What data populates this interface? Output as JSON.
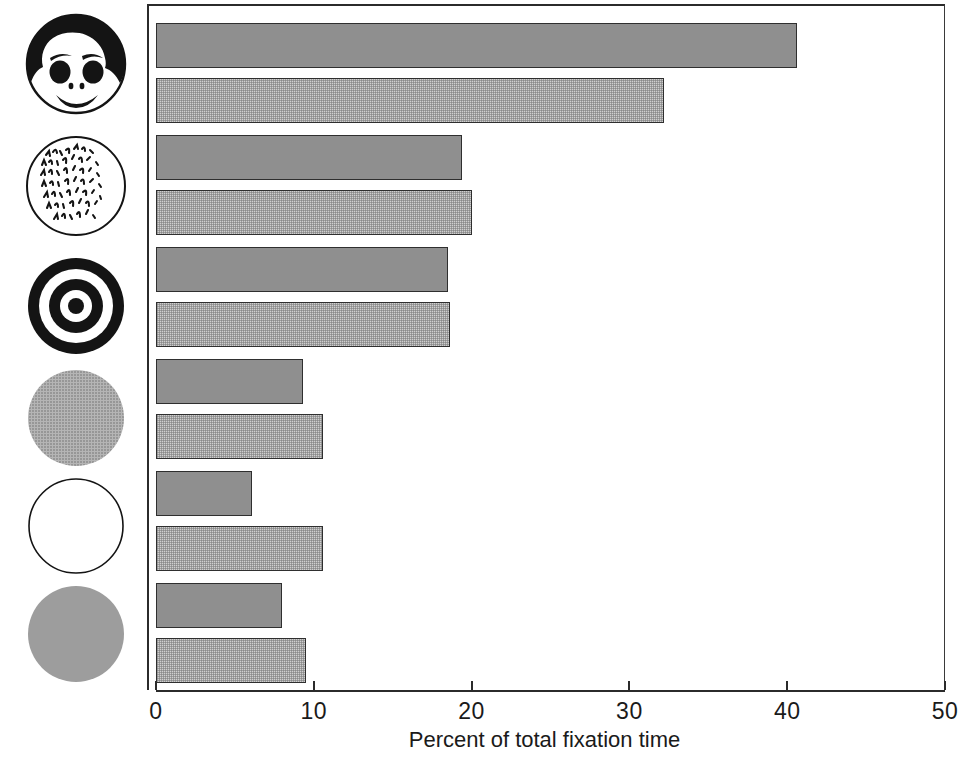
{
  "chart_data": {
    "type": "bar",
    "orientation": "horizontal",
    "title": "",
    "xlabel": "Percent of total fixation time",
    "ylabel": "",
    "xlim": [
      0,
      50
    ],
    "xticks": [
      0,
      10,
      20,
      30,
      40,
      50
    ],
    "xtick_labels": [
      "0",
      "10",
      "20",
      "30",
      "40",
      "50"
    ],
    "grid": false,
    "legend": "none",
    "categories": [
      "face",
      "handwritten-text",
      "bullseye",
      "gray-circle-halftone",
      "white-circle-outline",
      "gray-circle-solid"
    ],
    "series": [
      {
        "name": "dark-gray-bar",
        "color": "#8f8f8f",
        "values": [
          40.6,
          19.4,
          18.5,
          9.3,
          6.1,
          8.0
        ]
      },
      {
        "name": "light-gray-bar",
        "color": "#cfcfcf",
        "values": [
          32.2,
          20.0,
          18.6,
          10.6,
          10.6,
          9.5
        ]
      }
    ],
    "bars": [
      {
        "index": 0,
        "category": "face",
        "series": "dark-gray-bar",
        "value": 40.6,
        "shade": "dark"
      },
      {
        "index": 1,
        "category": "face",
        "series": "light-gray-bar",
        "value": 32.2,
        "shade": "light"
      },
      {
        "index": 2,
        "category": "handwritten-text",
        "series": "dark-gray-bar",
        "value": 19.4,
        "shade": "dark"
      },
      {
        "index": 3,
        "category": "handwritten-text",
        "series": "light-gray-bar",
        "value": 20.0,
        "shade": "light"
      },
      {
        "index": 4,
        "category": "bullseye",
        "series": "dark-gray-bar",
        "value": 18.5,
        "shade": "dark"
      },
      {
        "index": 5,
        "category": "bullseye",
        "series": "light-gray-bar",
        "value": 18.6,
        "shade": "light"
      },
      {
        "index": 6,
        "category": "gray-circle-halftone",
        "series": "dark-gray-bar",
        "value": 9.3,
        "shade": "dark"
      },
      {
        "index": 7,
        "category": "gray-circle-halftone",
        "series": "light-gray-bar",
        "value": 10.6,
        "shade": "light"
      },
      {
        "index": 8,
        "category": "white-circle-outline",
        "series": "dark-gray-bar",
        "value": 6.1,
        "shade": "dark"
      },
      {
        "index": 9,
        "category": "white-circle-outline",
        "series": "light-gray-bar",
        "value": 10.6,
        "shade": "light"
      },
      {
        "index": 10,
        "category": "gray-circle-solid",
        "series": "dark-gray-bar",
        "value": 8.0,
        "shade": "dark"
      },
      {
        "index": 11,
        "category": "gray-circle-solid",
        "series": "light-gray-bar",
        "value": 9.5,
        "shade": "light"
      }
    ]
  },
  "axis": {
    "x_title": "Percent of total fixation time",
    "ticks": [
      "0",
      "10",
      "20",
      "30",
      "40",
      "50"
    ]
  },
  "stimuli": [
    {
      "name": "face-stimulus-icon",
      "label": "face"
    },
    {
      "name": "handwritten-text-stimulus-icon",
      "label": "handwritten text"
    },
    {
      "name": "bullseye-stimulus-icon",
      "label": "bullseye"
    },
    {
      "name": "gray-circle-halftone-stimulus-icon",
      "label": "gray circle"
    },
    {
      "name": "white-circle-outline-stimulus-icon",
      "label": "white circle"
    },
    {
      "name": "gray-circle-solid-stimulus-icon",
      "label": "gray circle"
    }
  ],
  "colors": {
    "dark_bar": "#8f8f8f",
    "light_bar": "#cfcfcf",
    "bar_outline": "#2f2f2f",
    "axis": "#2b2b2b",
    "ink": "#141414",
    "background": "#ffffff"
  }
}
